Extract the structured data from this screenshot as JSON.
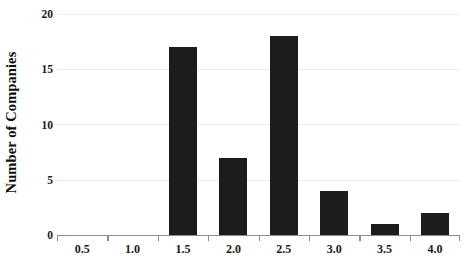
{
  "chart_data": {
    "type": "bar",
    "title": "",
    "subtitle": "",
    "xlabel": "",
    "ylabel": "Number of Companies",
    "categories": [
      "0.5",
      "1.0",
      "1.5",
      "2.0",
      "2.5",
      "3.0",
      "3.5",
      "4.0"
    ],
    "values": [
      0,
      0,
      17,
      7,
      18,
      4,
      1,
      2
    ],
    "ylim": [
      0,
      20
    ],
    "y_ticks": [
      "0",
      "5",
      "10",
      "15",
      "20"
    ],
    "y_tick_values": [
      0,
      5,
      10,
      15,
      20
    ],
    "grid": true,
    "grid_axis": "y",
    "legend": null,
    "legend_position": "none",
    "bar_color": "#1c1c1c",
    "gridline_color": "#ececec",
    "axis_color": "#8c8c8c",
    "text_color": "#1a1a1a",
    "background_color": "#ffffff"
  }
}
